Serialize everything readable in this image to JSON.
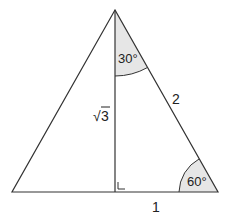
{
  "diagram": {
    "labels": {
      "angle_top": "30°",
      "angle_right": "60°",
      "hypotenuse": "2",
      "height": "3",
      "height_radical": "√",
      "base_half": "1"
    },
    "colors": {
      "line": "#333333",
      "fill": "#e6e6e6"
    }
  }
}
